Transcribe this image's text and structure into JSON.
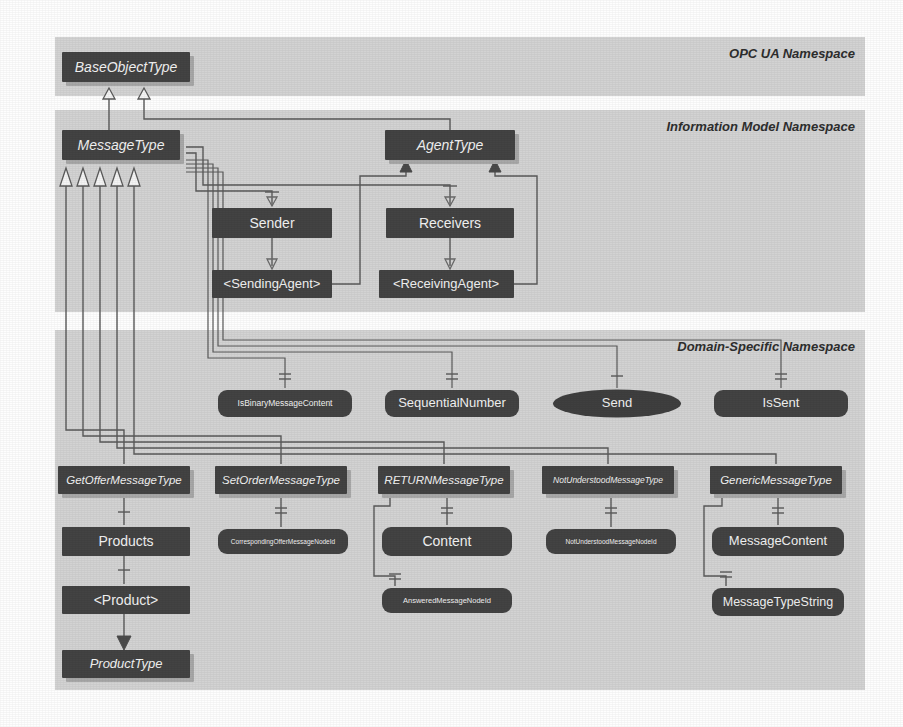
{
  "diagram": {
    "type": "uml-class-diagram",
    "canvas": {
      "width": 903,
      "height": 727,
      "background": "#fefefe"
    },
    "colors": {
      "band_fill": "#d3d3d3",
      "node_fill": "#434343",
      "node_shadow": "#a8a8a8",
      "node_text": "#f2f2f2",
      "edge": "#5a5a5a",
      "inheritance_triangle_fill": "#f4f4f4"
    },
    "bands": [
      {
        "id": "opcua",
        "label": "OPC UA Namespace",
        "x": 55,
        "y": 37,
        "w": 810,
        "h": 59
      },
      {
        "id": "infmod",
        "label": "Information Model Namespace",
        "x": 55,
        "y": 110,
        "w": 810,
        "h": 202
      },
      {
        "id": "domain",
        "label": "Domain-Specific Namespace",
        "x": 55,
        "y": 330,
        "w": 810,
        "h": 360
      }
    ],
    "nodes": [
      {
        "id": "baseObjectType",
        "label": "BaseObjectType",
        "shape": "type",
        "x": 62,
        "y": 52,
        "w": 128,
        "h": 30,
        "font": 14,
        "italic": true
      },
      {
        "id": "messageType",
        "label": "MessageType",
        "shape": "type",
        "x": 62,
        "y": 130,
        "w": 118,
        "h": 30,
        "font": 14,
        "italic": true
      },
      {
        "id": "agentType",
        "label": "AgentType",
        "shape": "type",
        "x": 385,
        "y": 130,
        "w": 130,
        "h": 30,
        "font": 14,
        "italic": true
      },
      {
        "id": "sender",
        "label": "Sender",
        "shape": "object",
        "x": 212,
        "y": 208,
        "w": 120,
        "h": 30,
        "font": 14,
        "italic": false
      },
      {
        "id": "receivers",
        "label": "Receivers",
        "shape": "object",
        "x": 386,
        "y": 208,
        "w": 128,
        "h": 30,
        "font": 14,
        "italic": false
      },
      {
        "id": "sendingAgent",
        "label": "<SendingAgent>",
        "shape": "object",
        "x": 212,
        "y": 270,
        "w": 120,
        "h": 28,
        "font": 13,
        "italic": false
      },
      {
        "id": "receivingAgent",
        "label": "<ReceivingAgent>",
        "shape": "object",
        "x": 379,
        "y": 270,
        "w": 135,
        "h": 28,
        "font": 13,
        "italic": false
      },
      {
        "id": "isBinaryMessageContent",
        "label": "IsBinaryMessageContent",
        "shape": "variable",
        "x": 218,
        "y": 390,
        "w": 134,
        "h": 27,
        "font": 8.5,
        "italic": false
      },
      {
        "id": "sequentialNumber",
        "label": "SequentialNumber",
        "shape": "variable",
        "x": 385,
        "y": 390,
        "w": 134,
        "h": 27,
        "font": 13,
        "italic": false
      },
      {
        "id": "send",
        "label": "Send",
        "shape": "method",
        "x": 553,
        "y": 390,
        "w": 128,
        "h": 27,
        "font": 13,
        "italic": false
      },
      {
        "id": "isSent",
        "label": "IsSent",
        "shape": "variable",
        "x": 714,
        "y": 390,
        "w": 134,
        "h": 27,
        "font": 13,
        "italic": false
      },
      {
        "id": "getOfferMessageType",
        "label": "GetOfferMessageType",
        "shape": "type",
        "x": 58,
        "y": 466,
        "w": 132,
        "h": 28,
        "font": 11.5,
        "italic": true
      },
      {
        "id": "setOrderMessageType",
        "label": "SetOrderMessageType",
        "shape": "type",
        "x": 215,
        "y": 466,
        "w": 132,
        "h": 28,
        "font": 11.5,
        "italic": true
      },
      {
        "id": "returnMessageType",
        "label": "RETURNMessageType",
        "shape": "type",
        "x": 378,
        "y": 466,
        "w": 132,
        "h": 28,
        "font": 11.5,
        "italic": true
      },
      {
        "id": "notUnderstoodMessageType",
        "label": "NotUnderstoodMessageType",
        "shape": "type",
        "x": 542,
        "y": 466,
        "w": 132,
        "h": 28,
        "font": 8.5,
        "italic": true
      },
      {
        "id": "genericMessageType",
        "label": "GenericMessageType",
        "shape": "type",
        "x": 710,
        "y": 466,
        "w": 132,
        "h": 28,
        "font": 11.5,
        "italic": true
      },
      {
        "id": "products",
        "label": "Products",
        "shape": "object",
        "x": 62,
        "y": 527,
        "w": 128,
        "h": 29,
        "font": 14,
        "italic": false
      },
      {
        "id": "correspondingOfferMessageNodeId",
        "label": "CorrespondingOfferMessageNodeId",
        "shape": "variable",
        "x": 218,
        "y": 529,
        "w": 130,
        "h": 25,
        "font": 6.5,
        "italic": false
      },
      {
        "id": "content",
        "label": "Content",
        "shape": "variable",
        "x": 382,
        "y": 527,
        "w": 130,
        "h": 29,
        "font": 14,
        "italic": false
      },
      {
        "id": "notUnderstoodMessageNodeId",
        "label": "NotUnderstoodMessageNodeId",
        "shape": "variable",
        "x": 546,
        "y": 529,
        "w": 130,
        "h": 25,
        "font": 6.5,
        "italic": false
      },
      {
        "id": "messageContent",
        "label": "MessageContent",
        "shape": "variable",
        "x": 712,
        "y": 527,
        "w": 132,
        "h": 29,
        "font": 13,
        "italic": false
      },
      {
        "id": "product",
        "label": "<Product>",
        "shape": "object",
        "x": 62,
        "y": 586,
        "w": 128,
        "h": 28,
        "font": 14,
        "italic": false
      },
      {
        "id": "answeredMessageNodeId",
        "label": "AnsweredMessageNodeId",
        "shape": "variable",
        "x": 382,
        "y": 588,
        "w": 130,
        "h": 25,
        "font": 7.5,
        "italic": false
      },
      {
        "id": "messageTypeString",
        "label": "MessageTypeString",
        "shape": "variable",
        "x": 712,
        "y": 588,
        "w": 132,
        "h": 28,
        "font": 12.5,
        "italic": false
      },
      {
        "id": "productType",
        "label": "ProductType",
        "shape": "type",
        "x": 62,
        "y": 650,
        "w": 128,
        "h": 28,
        "font": 13,
        "italic": true
      }
    ],
    "edges": [
      {
        "from": "messageType",
        "to": "baseObjectType",
        "kind": "inheritance"
      },
      {
        "from": "agentType",
        "to": "baseObjectType",
        "kind": "inheritance"
      },
      {
        "from": "messageType",
        "to": "sender",
        "kind": "hasComponent"
      },
      {
        "from": "messageType",
        "to": "receivers",
        "kind": "hasComponent"
      },
      {
        "from": "sender",
        "to": "sendingAgent",
        "kind": "hasComponent"
      },
      {
        "from": "receivers",
        "to": "receivingAgent",
        "kind": "hasComponent"
      },
      {
        "from": "sendingAgent",
        "to": "agentType",
        "kind": "hasTypeDefinition"
      },
      {
        "from": "receivingAgent",
        "to": "agentType",
        "kind": "hasTypeDefinition"
      },
      {
        "from": "messageType",
        "to": "isBinaryMessageContent",
        "kind": "hasProperty"
      },
      {
        "from": "messageType",
        "to": "sequentialNumber",
        "kind": "hasProperty"
      },
      {
        "from": "messageType",
        "to": "send",
        "kind": "hasComponent"
      },
      {
        "from": "messageType",
        "to": "isSent",
        "kind": "hasProperty"
      },
      {
        "from": "getOfferMessageType",
        "to": "messageType",
        "kind": "inheritance"
      },
      {
        "from": "setOrderMessageType",
        "to": "messageType",
        "kind": "inheritance"
      },
      {
        "from": "returnMessageType",
        "to": "messageType",
        "kind": "inheritance"
      },
      {
        "from": "notUnderstoodMessageType",
        "to": "messageType",
        "kind": "inheritance"
      },
      {
        "from": "genericMessageType",
        "to": "messageType",
        "kind": "inheritance"
      },
      {
        "from": "getOfferMessageType",
        "to": "products",
        "kind": "hasComponent"
      },
      {
        "from": "setOrderMessageType",
        "to": "correspondingOfferMessageNodeId",
        "kind": "hasProperty"
      },
      {
        "from": "returnMessageType",
        "to": "content",
        "kind": "hasProperty"
      },
      {
        "from": "returnMessageType",
        "to": "answeredMessageNodeId",
        "kind": "hasProperty"
      },
      {
        "from": "notUnderstoodMessageType",
        "to": "notUnderstoodMessageNodeId",
        "kind": "hasProperty"
      },
      {
        "from": "genericMessageType",
        "to": "messageContent",
        "kind": "hasProperty"
      },
      {
        "from": "genericMessageType",
        "to": "messageTypeString",
        "kind": "hasProperty"
      },
      {
        "from": "products",
        "to": "product",
        "kind": "hasComponent"
      },
      {
        "from": "product",
        "to": "productType",
        "kind": "hasTypeDefinition"
      }
    ]
  }
}
